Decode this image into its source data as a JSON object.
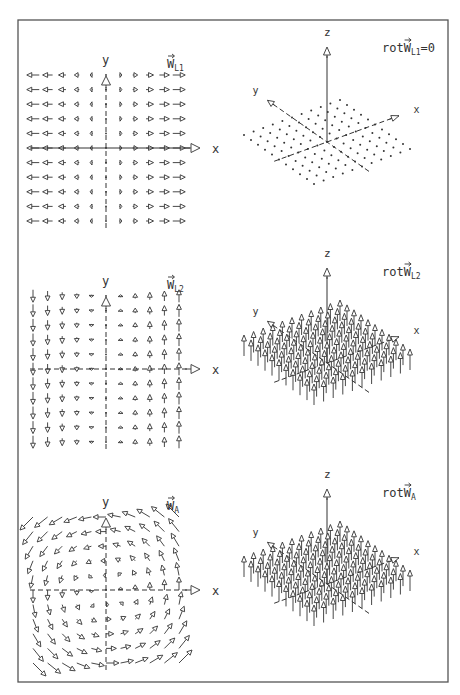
{
  "figure": {
    "frame": {
      "x": 18,
      "y": 20,
      "w": 430,
      "h": 662
    },
    "panel_offset_y": 221,
    "grid": {
      "n": 11,
      "half": 5,
      "spacing": 14.6
    },
    "rows": [
      {
        "field_2d": {
          "name": "W_L1",
          "label_base": "W",
          "label_sub": "L1",
          "formula": "(x, 0)",
          "description": "horizontal field, magnitude proportional to x"
        },
        "curl_3d": {
          "label_prefix": "rot",
          "label_base": "W",
          "label_sub": "L1",
          "label_suffix": "=0",
          "value": 0,
          "render": "dots"
        }
      },
      {
        "field_2d": {
          "name": "W_L2",
          "label_base": "W",
          "label_sub": "L2",
          "formula": "(0, x)",
          "description": "vertical field, magnitude proportional to x"
        },
        "curl_3d": {
          "label_prefix": "rot",
          "label_base": "W",
          "label_sub": "L2",
          "label_suffix": "",
          "value": 1,
          "render": "arrows"
        }
      },
      {
        "field_2d": {
          "name": "W_A",
          "label_base": "W",
          "label_sub": "A",
          "formula": "(-y, x)",
          "description": "counter-clockwise rotational field"
        },
        "curl_3d": {
          "label_prefix": "rot",
          "label_base": "W",
          "label_sub": "A",
          "label_suffix": "",
          "value": 2,
          "render": "arrows"
        }
      }
    ],
    "axis_labels": {
      "x": "x",
      "y": "y",
      "z": "z"
    },
    "caption_text": ""
  },
  "chart_data": [
    {
      "type": "vector_field",
      "title": "W_L1",
      "x_range": [
        -5,
        5
      ],
      "y_range": [
        -5,
        5
      ],
      "grid": 11,
      "vector": "(x, 0)",
      "curl": 0
    },
    {
      "type": "vector_field",
      "title": "W_L2",
      "x_range": [
        -5,
        5
      ],
      "y_range": [
        -5,
        5
      ],
      "grid": 11,
      "vector": "(0, x)",
      "curl": 1
    },
    {
      "type": "vector_field",
      "title": "W_A",
      "x_range": [
        -5,
        5
      ],
      "y_range": [
        -5,
        5
      ],
      "grid": 11,
      "vector": "(-y, x)",
      "curl": 2
    },
    {
      "type": "vector_field_3d",
      "title": "rot W_L1 = 0",
      "plane": "xy",
      "grid": 11,
      "z_component": 0
    },
    {
      "type": "vector_field_3d",
      "title": "rot W_L2",
      "plane": "xy",
      "grid": 11,
      "z_component": "constant, positive"
    },
    {
      "type": "vector_field_3d",
      "title": "rot W_A",
      "plane": "xy",
      "grid": 11,
      "z_component": "constant, positive"
    }
  ]
}
